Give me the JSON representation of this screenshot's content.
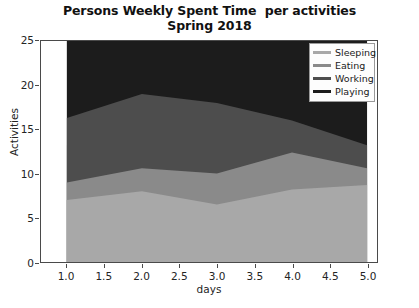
{
  "figure": {
    "title_line1": "Persons Weekly Spent Time  per activities",
    "title_line2": "Spring 2018"
  },
  "legend": {
    "position": "upper right",
    "items": [
      {
        "label": "Sleeping",
        "color": "#a8a8a8"
      },
      {
        "label": "Eating",
        "color": "#8a8a8a"
      },
      {
        "label": "Working",
        "color": "#4d4d4d"
      },
      {
        "label": "Playing",
        "color": "#1c1c1c"
      }
    ]
  },
  "axes": {
    "xlabel": "days",
    "ylabel": "Activities",
    "xticks": [
      "1.0",
      "1.5",
      "2.0",
      "2.5",
      "3.0",
      "3.5",
      "4.0",
      "4.5",
      "5.0"
    ],
    "yticks": [
      "0",
      "5",
      "10",
      "15",
      "20",
      "25"
    ]
  },
  "chart_data": {
    "type": "area",
    "stacked": true,
    "title": "Persons Weekly Spent Time  per activities\nSpring 2018",
    "xlabel": "days",
    "ylabel": "Activities",
    "xlim": [
      1.0,
      5.0
    ],
    "ylim": [
      0,
      25
    ],
    "grid": false,
    "legend_position": "upper right",
    "x": [
      1,
      2,
      3,
      4,
      5
    ],
    "series": [
      {
        "name": "Sleeping",
        "color": "#a8a8a8",
        "values": [
          7,
          8,
          6.5,
          8.2,
          8.7
        ]
      },
      {
        "name": "Eating",
        "color": "#8a8a8a",
        "values": [
          2,
          2.6,
          3.5,
          4.2,
          1.9
        ]
      },
      {
        "name": "Working",
        "color": "#4d4d4d",
        "values": [
          7.3,
          8.4,
          8,
          3.6,
          2.6
        ]
      },
      {
        "name": "Playing",
        "color": "#1c1c1c",
        "values": [
          8.7,
          6,
          7.5,
          9,
          11.8
        ]
      }
    ],
    "cumulative": [
      {
        "name": "Sleeping",
        "values": [
          7,
          8,
          6.5,
          8.2,
          8.7
        ]
      },
      {
        "name": "Eating",
        "values": [
          9,
          10.6,
          10,
          12.4,
          10.6
        ]
      },
      {
        "name": "Working",
        "values": [
          16.3,
          19,
          18,
          16,
          13.2
        ]
      },
      {
        "name": "Playing",
        "values": [
          25,
          25,
          25.5,
          25,
          25
        ]
      }
    ]
  }
}
